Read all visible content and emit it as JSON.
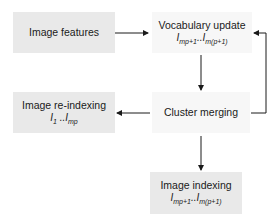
{
  "diagram": {
    "nodes": [
      {
        "id": "image-features",
        "label": "Image features",
        "sub": ""
      },
      {
        "id": "vocabulary-update",
        "label": "Vocabulary update",
        "sub": "I",
        "sub_a": "mp+1",
        "sub_sep": "..I",
        "sub_b": "m(p+1)"
      },
      {
        "id": "image-reindexing",
        "label": "Image re-indexing",
        "sub": "I",
        "sub_a": "1",
        "sub_sep": " ..I",
        "sub_b": "mp"
      },
      {
        "id": "cluster-merging",
        "label": "Cluster merging",
        "sub": ""
      },
      {
        "id": "image-indexing",
        "label": "Image indexing",
        "sub": "I",
        "sub_a": "mp+1",
        "sub_sep": "..I",
        "sub_b": "m(p+1)"
      }
    ],
    "edges": [
      {
        "from": "image-features",
        "to": "vocabulary-update"
      },
      {
        "from": "vocabulary-update",
        "to": "cluster-merging"
      },
      {
        "from": "cluster-merging",
        "to": "image-reindexing"
      },
      {
        "from": "cluster-merging",
        "to": "vocabulary-update"
      },
      {
        "from": "cluster-merging",
        "to": "image-indexing"
      }
    ],
    "colors": {
      "box_dark": "#e9e9e9",
      "box_light": "#f7f7f7",
      "line": "#1a1a1a"
    }
  }
}
